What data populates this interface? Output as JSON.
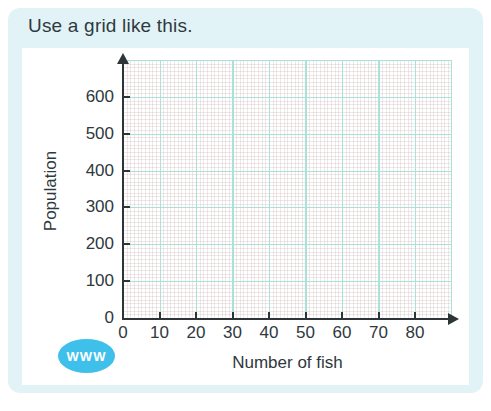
{
  "page": {
    "title": "Use a grid like this."
  },
  "badge": {
    "label": "WWW",
    "color": "#3ec0ea"
  },
  "colors": {
    "card_background": "#e2f3f8",
    "grid_major": "#a9e2d8",
    "grid_minor": "#efe8e8",
    "axis": "#2e3538",
    "text": "#2f383c"
  },
  "chart_data": {
    "type": "line",
    "series": [],
    "title": "",
    "xlabel": "Number of fish",
    "ylabel": "Population",
    "x_ticks": [
      0,
      10,
      20,
      30,
      40,
      50,
      60,
      70,
      80
    ],
    "y_ticks": [
      0,
      100,
      200,
      300,
      400,
      500,
      600
    ],
    "xlim": [
      0,
      90
    ],
    "ylim": [
      0,
      700
    ],
    "grid": "on",
    "minor_grid": "on",
    "legend": "none",
    "note": "empty grid provided for plotting"
  }
}
